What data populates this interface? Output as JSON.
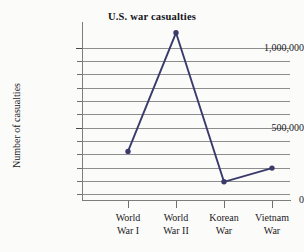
{
  "chart_data": {
    "type": "line",
    "title": "U.S. war casualties",
    "xlabel": "",
    "ylabel": "Number of casualties",
    "categories": [
      "World War I",
      "World War II",
      "Korean War",
      "Vietnam War"
    ],
    "category_lines": [
      [
        "World",
        "War I"
      ],
      [
        "World",
        "War II"
      ],
      [
        "Korean",
        "War"
      ],
      [
        "Vietnam",
        "War"
      ]
    ],
    "values": [
      320000,
      1100000,
      120000,
      210000
    ],
    "ylim": [
      0,
      1140000
    ],
    "y_tick_labels": [
      "1,000,000",
      "500,000",
      "0"
    ],
    "y_tick_values": [
      1000000,
      500000,
      0
    ],
    "gridlines": true,
    "gridline_step": 100000,
    "gridline_count": 12,
    "legend": "none",
    "marker": "filled-circle",
    "series_color": "#3b3b6b",
    "grid_color": "#8d8d8d",
    "axis_color": "#7d7d7d",
    "background_color": "#fbfbfa"
  }
}
